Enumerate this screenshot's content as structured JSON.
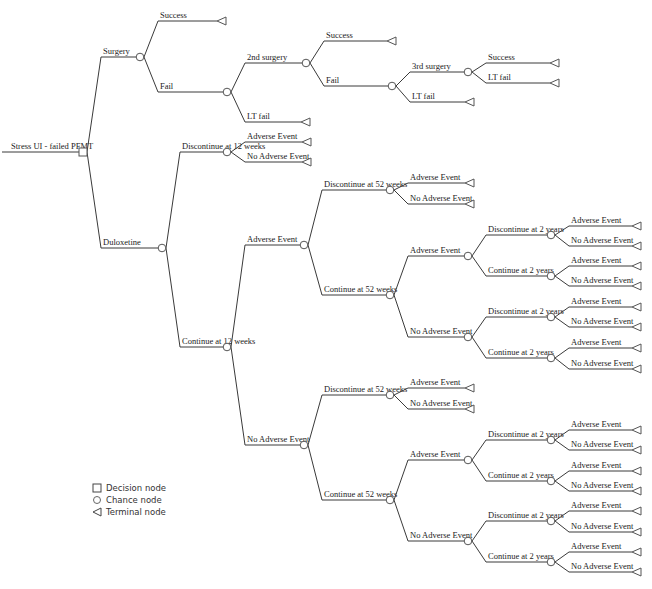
{
  "title": "Stress UI - failed PFMT",
  "legend": {
    "decision": "Decision node",
    "chance": "Chance node",
    "terminal": "Terminal node"
  },
  "tree": {
    "label": "Stress UI - failed PFMT",
    "type": "decision",
    "x": 83,
    "y": 152,
    "children": [
      {
        "label": "Surgery",
        "type": "chance",
        "x": 140,
        "y": 57,
        "children": [
          {
            "label": "Success",
            "type": "terminal",
            "x": 222,
            "y": 21
          },
          {
            "label": "Fail",
            "type": "chance",
            "x": 227,
            "y": 92,
            "children": [
              {
                "label": "2nd surgery",
                "type": "chance",
                "x": 306,
                "y": 63,
                "children": [
                  {
                    "label": "Success",
                    "type": "terminal",
                    "x": 392,
                    "y": 41
                  },
                  {
                    "label": "Fail",
                    "type": "chance",
                    "x": 392,
                    "y": 86,
                    "children": [
                      {
                        "label": "3rd surgery",
                        "type": "chance",
                        "x": 468,
                        "y": 72,
                        "children": [
                          {
                            "label": "Success",
                            "type": "terminal",
                            "x": 555,
                            "y": 63
                          },
                          {
                            "label": "LT fail",
                            "type": "terminal",
                            "x": 555,
                            "y": 83
                          }
                        ]
                      },
                      {
                        "label": "LT fail",
                        "type": "terminal",
                        "x": 470,
                        "y": 102
                      }
                    ]
                  }
                ]
              },
              {
                "label": "LT fail",
                "type": "terminal",
                "x": 306,
                "y": 122
              }
            ]
          }
        ]
      },
      {
        "label": "Duloxetine",
        "type": "chance",
        "x": 162,
        "y": 248,
        "children": [
          {
            "label": "Discontinue at 12 weeks",
            "type": "chance",
            "x": 227,
            "y": 152,
            "children": [
              {
                "label": "Adverse Event",
                "type": "terminal",
                "x": 307,
                "y": 142
              },
              {
                "label": "No Adverse Event",
                "type": "terminal",
                "x": 307,
                "y": 162
              }
            ]
          },
          {
            "label": "Continue at 12 weeks",
            "type": "chance",
            "x": 227,
            "y": 347,
            "children": [
              {
                "label": "Adverse Event",
                "type": "chance",
                "x": 304,
                "y": 245,
                "children": [
                  {
                    "label": "Discontinue at 52 weeks",
                    "type": "chance",
                    "x": 390,
                    "y": 190,
                    "children": [
                      {
                        "label": "Adverse Event",
                        "type": "terminal",
                        "x": 470,
                        "y": 183
                      },
                      {
                        "label": "No Adverse Event",
                        "type": "terminal",
                        "x": 470,
                        "y": 204
                      }
                    ]
                  },
                  {
                    "label": "Continue at 52 weeks",
                    "type": "chance",
                    "x": 390,
                    "y": 295,
                    "children": [
                      {
                        "label": "Adverse Event",
                        "type": "chance",
                        "x": 468,
                        "y": 256,
                        "children": [
                          {
                            "label": "Discontinue at 2 years",
                            "type": "chance",
                            "x": 551,
                            "y": 235,
                            "children": [
                              {
                                "label": "Adverse Event",
                                "type": "terminal",
                                "x": 637,
                                "y": 226
                              },
                              {
                                "label": "No Adverse Event",
                                "type": "terminal",
                                "x": 637,
                                "y": 246
                              }
                            ]
                          },
                          {
                            "label": "Continue at 2 years",
                            "type": "chance",
                            "x": 551,
                            "y": 276,
                            "children": [
                              {
                                "label": "Adverse Event",
                                "type": "terminal",
                                "x": 637,
                                "y": 266
                              },
                              {
                                "label": "No Adverse Event",
                                "type": "terminal",
                                "x": 637,
                                "y": 286
                              }
                            ]
                          }
                        ]
                      },
                      {
                        "label": "No Adverse Event",
                        "type": "chance",
                        "x": 468,
                        "y": 337,
                        "children": [
                          {
                            "label": "Discontinue at 2 years",
                            "type": "chance",
                            "x": 551,
                            "y": 317,
                            "children": [
                              {
                                "label": "Adverse Event",
                                "type": "terminal",
                                "x": 637,
                                "y": 307
                              },
                              {
                                "label": "No Adverse Event",
                                "type": "terminal",
                                "x": 637,
                                "y": 327
                              }
                            ]
                          },
                          {
                            "label": "Continue at 2 years",
                            "type": "chance",
                            "x": 551,
                            "y": 358,
                            "children": [
                              {
                                "label": "Adverse Event",
                                "type": "terminal",
                                "x": 637,
                                "y": 348
                              },
                              {
                                "label": "No Adverse Event",
                                "type": "terminal",
                                "x": 637,
                                "y": 369
                              }
                            ]
                          }
                        ]
                      }
                    ]
                  }
                ]
              },
              {
                "label": "No Adverse Event",
                "type": "chance",
                "x": 304,
                "y": 445,
                "children": [
                  {
                    "label": "Discontinue at 52 weeks",
                    "type": "chance",
                    "x": 390,
                    "y": 395,
                    "children": [
                      {
                        "label": "Adverse Event",
                        "type": "terminal",
                        "x": 470,
                        "y": 388
                      },
                      {
                        "label": "No Adverse Event",
                        "type": "terminal",
                        "x": 470,
                        "y": 409
                      }
                    ]
                  },
                  {
                    "label": "Continue at 52 weeks",
                    "type": "chance",
                    "x": 390,
                    "y": 500,
                    "children": [
                      {
                        "label": "Adverse Event",
                        "type": "chance",
                        "x": 468,
                        "y": 460,
                        "children": [
                          {
                            "label": "Discontinue at 2 years",
                            "type": "chance",
                            "x": 551,
                            "y": 440,
                            "children": [
                              {
                                "label": "Adverse Event",
                                "type": "terminal",
                                "x": 637,
                                "y": 430
                              },
                              {
                                "label": "No Adverse Event",
                                "type": "terminal",
                                "x": 637,
                                "y": 450
                              }
                            ]
                          },
                          {
                            "label": "Continue at 2 years",
                            "type": "chance",
                            "x": 551,
                            "y": 481,
                            "children": [
                              {
                                "label": "Adverse Event",
                                "type": "terminal",
                                "x": 637,
                                "y": 471
                              },
                              {
                                "label": "No Adverse Event",
                                "type": "terminal",
                                "x": 637,
                                "y": 491
                              }
                            ]
                          }
                        ]
                      },
                      {
                        "label": "No Adverse Event",
                        "type": "chance",
                        "x": 468,
                        "y": 541,
                        "children": [
                          {
                            "label": "Discontinue at 2 years",
                            "type": "chance",
                            "x": 551,
                            "y": 521,
                            "children": [
                              {
                                "label": "Adverse Event",
                                "type": "terminal",
                                "x": 637,
                                "y": 511
                              },
                              {
                                "label": "No Adverse Event",
                                "type": "terminal",
                                "x": 637,
                                "y": 532
                              }
                            ]
                          },
                          {
                            "label": "Continue at 2 years",
                            "type": "chance",
                            "x": 551,
                            "y": 562,
                            "children": [
                              {
                                "label": "Adverse Event",
                                "type": "terminal",
                                "x": 637,
                                "y": 552
                              },
                              {
                                "label": "No Adverse Event",
                                "type": "terminal",
                                "x": 637,
                                "y": 572
                              }
                            ]
                          }
                        ]
                      }
                    ]
                  }
                ]
              }
            ]
          }
        ]
      }
    ]
  }
}
